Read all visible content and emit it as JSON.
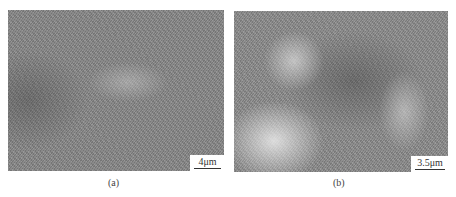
{
  "figure": {
    "panels": [
      {
        "label": "(a)",
        "scale_bar": "4μm"
      },
      {
        "label": "(b)",
        "scale_bar": "3.5μm"
      }
    ]
  }
}
